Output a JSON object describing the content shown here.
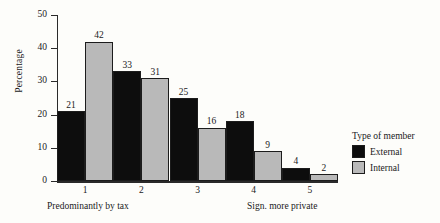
{
  "chart_data": {
    "type": "bar",
    "title": "",
    "xlabel": "",
    "ylabel": "Percentage",
    "ylim": [
      0,
      50
    ],
    "yticks": [
      0,
      10,
      20,
      30,
      40,
      50
    ],
    "grid": false,
    "categories": [
      "1",
      "2",
      "3",
      "4",
      "5"
    ],
    "axis_anchors": {
      "left": "Predominantly by tax",
      "right": "Sign. more private"
    },
    "legend": {
      "title": "Type of member",
      "position": "right",
      "entries": [
        {
          "name": "External",
          "color": "#0d0d0d"
        },
        {
          "name": "Internal",
          "color": "#b9b9b9"
        }
      ]
    },
    "series": [
      {
        "name": "External",
        "color": "#0d0d0d",
        "values": [
          21,
          33,
          25,
          18,
          4
        ]
      },
      {
        "name": "Internal",
        "color": "#b9b9b9",
        "values": [
          42,
          31,
          16,
          9,
          2
        ]
      }
    ]
  }
}
